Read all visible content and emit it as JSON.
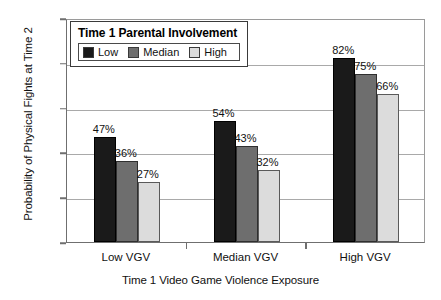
{
  "chart_data": {
    "type": "bar",
    "title": "",
    "xlabel": "Time 1 Video Game Violence Exposure",
    "ylabel": "Probability of Physical Fights at Time 2",
    "categories": [
      "Low VGV",
      "Median VGV",
      "High VGV"
    ],
    "series": [
      {
        "name": "Low",
        "color": "#1a1a1a",
        "values": [
          47,
          36,
          82
        ],
        "labels": [
          "47%",
          "36%",
          "82%"
        ]
      },
      {
        "name": "Median",
        "color": "#6e6e6e",
        "values": [
          36,
          43,
          75
        ],
        "labels": [
          "36%",
          "43%",
          "75%"
        ]
      },
      {
        "name": "High",
        "color": "#dcdcdc",
        "values": [
          27,
          32,
          66
        ],
        "labels": [
          "27%",
          "32%",
          "66%"
        ]
      }
    ],
    "values_by_group": [
      {
        "group": "Low VGV",
        "Low": 47,
        "Median": 36,
        "High": 27
      },
      {
        "group": "Median VGV",
        "Low": 54,
        "Median": 43,
        "High": 32
      },
      {
        "group": "High VGV",
        "Low": 82,
        "Median": 75,
        "High": 66
      }
    ],
    "ylim": [
      0,
      100
    ],
    "ytick_labels": [
      "0%",
      "20%",
      "40%",
      "60%",
      "80%",
      "100%"
    ],
    "ytick_values": [
      0,
      20,
      40,
      60,
      80,
      100
    ],
    "grid": true,
    "grid_axis": "y",
    "legend_position": "top-left"
  },
  "legend": {
    "title": "Time 1 Parental Involvement",
    "entries": [
      {
        "label": "Low",
        "color": "#1a1a1a"
      },
      {
        "label": "Median",
        "color": "#6e6e6e"
      },
      {
        "label": "High",
        "color": "#dcdcdc"
      }
    ]
  },
  "axes": {
    "y_title": "Probability of Physical Fights at Time 2",
    "x_title": "Time 1 Video Game Violence Exposure",
    "y_ticks": [
      "100%",
      "80%",
      "60%",
      "40%",
      "20%",
      "0%"
    ],
    "x_ticks": [
      "Low VGV",
      "Median VGV",
      "High VGV"
    ]
  },
  "bar_labels": {
    "g0": [
      "47%",
      "36%",
      "27%"
    ],
    "g1": [
      "54%",
      "43%",
      "32%"
    ],
    "g2": [
      "82%",
      "75%",
      "66%"
    ]
  }
}
